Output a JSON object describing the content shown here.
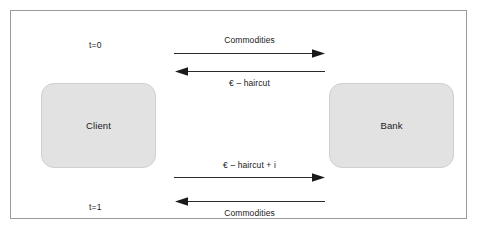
{
  "diagram": {
    "frame": {
      "border_color": "#9a9a9a",
      "background": "#ffffff"
    },
    "parties": [
      {
        "id": "client",
        "label": "Client",
        "fill": "#e2e2e2"
      },
      {
        "id": "bank",
        "label": "Bank",
        "fill": "#e2e2e2"
      }
    ],
    "time_markers": [
      {
        "id": "t0",
        "label": "t=0"
      },
      {
        "id": "t1",
        "label": "t=1"
      }
    ],
    "flows": [
      {
        "id": "flow-1",
        "label": "Commodities",
        "direction": "right",
        "from": "Client",
        "to": "Bank",
        "label_position": "above",
        "time": "t=0"
      },
      {
        "id": "flow-2",
        "label": "€ – haircut",
        "direction": "left",
        "from": "Bank",
        "to": "Client",
        "label_position": "below",
        "time": "t=0"
      },
      {
        "id": "flow-3",
        "label": "€ – haircut + i",
        "direction": "right",
        "from": "Client",
        "to": "Bank",
        "label_position": "above",
        "time": "t=1"
      },
      {
        "id": "flow-4",
        "label": "Commodities",
        "direction": "left",
        "from": "Bank",
        "to": "Client",
        "label_position": "below",
        "time": "t=1"
      }
    ]
  }
}
